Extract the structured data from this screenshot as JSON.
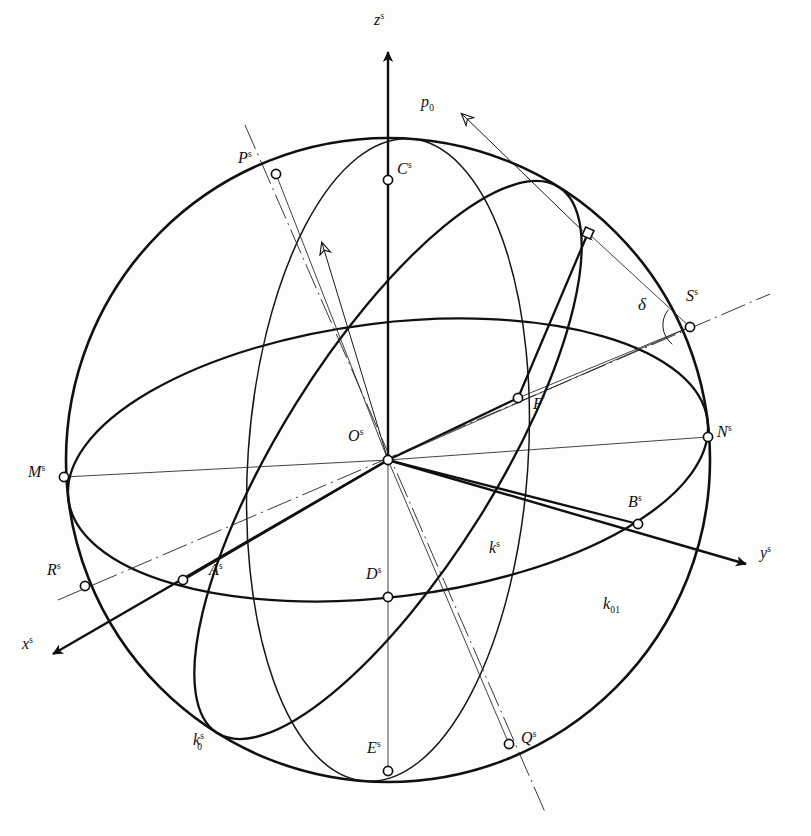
{
  "figure": {
    "background": "#fdfdfc",
    "ink": "#101010",
    "width": 811,
    "height": 836
  },
  "axes": [
    {
      "id": "z",
      "label": "z",
      "sup": "s",
      "label_x": 381,
      "label_y": 20,
      "from": [
        388,
        460
      ],
      "to": [
        388,
        48
      ],
      "arrow": true
    },
    {
      "id": "y",
      "label": "y",
      "sup": "s",
      "label_x": 763,
      "label_y": 553,
      "from": [
        388,
        460
      ],
      "to": [
        752,
        566
      ],
      "arrow": true
    },
    {
      "id": "x",
      "label": "x",
      "sup": "s",
      "label_x": 24,
      "label_y": 643,
      "from": [
        388,
        460
      ],
      "to": [
        47,
        657
      ],
      "arrow": true
    }
  ],
  "vectors": [
    {
      "id": "p0",
      "label": "p",
      "sub": "0",
      "label_x": 424,
      "label_y": 101,
      "from": [
        592,
        240
      ],
      "to": [
        457,
        110
      ],
      "arrow": true
    },
    {
      "id": "of-ray",
      "from": [
        388,
        460
      ],
      "to": [
        318,
        237
      ],
      "arrow": true
    }
  ],
  "points": [
    {
      "name": "P",
      "sup": "s",
      "x": 276,
      "y": 174,
      "label_x": 240,
      "label_y": 157
    },
    {
      "name": "C",
      "sup": "s",
      "x": 388,
      "y": 180,
      "label_x": 397,
      "label_y": 166
    },
    {
      "name": "S",
      "sup": "s",
      "x": 690,
      "y": 327,
      "label_x": 687,
      "label_y": 297
    },
    {
      "name": "N",
      "sup": "s",
      "x": 708,
      "y": 437,
      "label_x": 716,
      "label_y": 425
    },
    {
      "name": "M",
      "sup": "s",
      "x": 64,
      "y": 477,
      "label_x": 30,
      "label_y": 466
    },
    {
      "name": "F",
      "sup": "'",
      "x": 518,
      "y": 398,
      "label_x": 531,
      "label_y": 398
    },
    {
      "name": "O",
      "sup": "s",
      "x": 388,
      "y": 460,
      "label_x": 351,
      "label_y": 434
    },
    {
      "name": "B",
      "sup": "s",
      "x": 638,
      "y": 524,
      "label_x": 630,
      "label_y": 500
    },
    {
      "name": "R",
      "sup": "s",
      "x": 85,
      "y": 586,
      "label_x": 50,
      "label_y": 567
    },
    {
      "name": "A",
      "sup": "s",
      "x": 183,
      "y": 580,
      "label_x": 209,
      "label_y": 567
    },
    {
      "name": "D",
      "sup": "s",
      "x": 388,
      "y": 597,
      "label_x": 368,
      "label_y": 570
    },
    {
      "name": "Q",
      "sup": "s",
      "x": 509,
      "y": 744,
      "label_x": 520,
      "label_y": 734
    },
    {
      "name": "E",
      "sup": "s",
      "x": 388,
      "y": 771,
      "label_x": 369,
      "label_y": 744
    }
  ],
  "curve_labels": [
    {
      "id": "k-s",
      "text": "k",
      "sup": "s",
      "x": 493,
      "y": 548
    },
    {
      "id": "k0-s",
      "text": "k",
      "sup": "s",
      "sub": "0",
      "x": 196,
      "y": 740
    },
    {
      "id": "k01",
      "text": "k",
      "sub": "01",
      "x": 606,
      "y": 604
    },
    {
      "id": "delta",
      "text": "δ",
      "x": 642,
      "y": 305
    }
  ],
  "markers": [
    {
      "id": "right-angle-square",
      "x": 588,
      "y": 233,
      "size": 9
    },
    {
      "id": "angle-arc-delta",
      "cx": 690,
      "cy": 327,
      "r": 22
    }
  ],
  "geometry": {
    "sphere": {
      "cx": 388,
      "cy": 460,
      "r": 322
    },
    "equator_ellipse": {
      "cx": 388,
      "cy": 460,
      "rx": 322,
      "ry": 137,
      "rotation": -7
    },
    "meridian_ellipse": {
      "cx": 388,
      "cy": 460,
      "rx": 138,
      "ry": 322,
      "rotation": 3
    }
  }
}
